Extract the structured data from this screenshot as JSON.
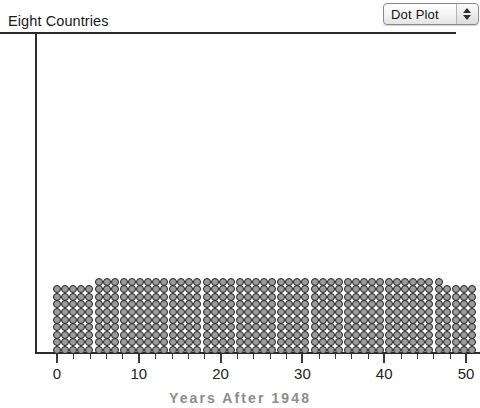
{
  "window": {
    "title": "Eight Countries"
  },
  "controls": {
    "plot_type_menu": {
      "name": "plot-type-popup",
      "selected": "Dot Plot",
      "options": [
        "Dot Plot",
        "Histogram",
        "Box Plot",
        "Scatter Plot"
      ],
      "up_arrow_icon": "triangle-up-icon",
      "down_arrow_icon": "triangle-down-icon"
    }
  },
  "chart_data": {
    "type": "scatter",
    "title": "Eight Countries",
    "xlabel": "Years After 1948",
    "ylabel": "",
    "xlim": [
      -1,
      51
    ],
    "ylim": [
      0,
      40
    ],
    "grid": false,
    "legend": null,
    "xticks": [
      0,
      10,
      20,
      30,
      40,
      50
    ],
    "xticklabels": [
      "0",
      "10",
      "20",
      "30",
      "40",
      "50"
    ],
    "minor_tick_interval": 2,
    "dot_style": {
      "fill": "#9b9b9b",
      "stroke": "#1f1f1f",
      "diameter_px": 8
    },
    "x": [
      0,
      1,
      2,
      3,
      4,
      5,
      6,
      7,
      8,
      9,
      10,
      11,
      12,
      13,
      14,
      15,
      16,
      17,
      18,
      19,
      20,
      21,
      22,
      23,
      24,
      25,
      26,
      27,
      28,
      29,
      30,
      31,
      32,
      33,
      34,
      35,
      36,
      37,
      38,
      39,
      40,
      41,
      42,
      43,
      44,
      45,
      46,
      47,
      48,
      49,
      50
    ],
    "counts": [
      9,
      9,
      9,
      9,
      9,
      10,
      10,
      10,
      10,
      10,
      10,
      10,
      10,
      10,
      10,
      10,
      10,
      10,
      10,
      10,
      10,
      10,
      10,
      10,
      10,
      10,
      10,
      10,
      10,
      10,
      10,
      10,
      10,
      10,
      10,
      10,
      10,
      10,
      10,
      10,
      10,
      10,
      10,
      10,
      10,
      10,
      10,
      9,
      9,
      9,
      9
    ],
    "column_group_breaks": [
      5,
      18,
      31,
      46
    ],
    "total_points": 503
  }
}
